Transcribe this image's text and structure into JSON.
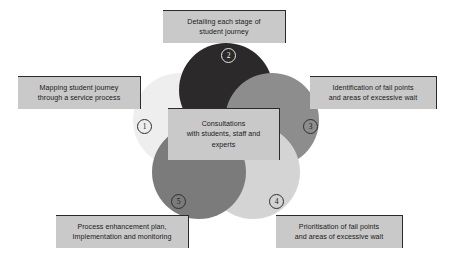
{
  "diagram": {
    "background_color": "#ffffff",
    "center": {
      "text": "Consultations\nwith students, staff and\nexperts",
      "box_color": "#c9c9c9",
      "shadow_color": "#2b2b2b",
      "x": 168,
      "y": 108,
      "w": 112,
      "h": 52
    },
    "circles": [
      {
        "id": 1,
        "name": "mapping-student-journey",
        "color": "#efeeee",
        "cx": 47,
        "cy": 72,
        "r": 47
      },
      {
        "id": 2,
        "name": "detailing-each-stage",
        "color": "#2b2929",
        "cx": 93,
        "cy": 42,
        "r": 47
      },
      {
        "id": 3,
        "name": "identification-fail-points",
        "color": "#8d8d8d",
        "cx": 139,
        "cy": 72,
        "r": 47
      },
      {
        "id": 4,
        "name": "prioritisation-fail-points",
        "color": "#d5d4d4",
        "cx": 120,
        "cy": 124,
        "r": 47
      },
      {
        "id": 5,
        "name": "process-enhancement-plan",
        "color": "#7c7b7b",
        "cx": 66,
        "cy": 124,
        "r": 47
      }
    ],
    "markers": [
      {
        "id": 1,
        "label": "1",
        "x": 137,
        "y": 119,
        "tone": "onlight"
      },
      {
        "id": 2,
        "label": "2",
        "x": 221,
        "y": 48,
        "tone": "ondark"
      },
      {
        "id": 3,
        "label": "3",
        "x": 303,
        "y": 119,
        "tone": "onlight"
      },
      {
        "id": 4,
        "label": "4",
        "x": 269,
        "y": 194,
        "tone": "onlight"
      },
      {
        "id": 5,
        "label": "5",
        "x": 171,
        "y": 194,
        "tone": "onlight"
      }
    ],
    "labels": [
      {
        "id": 1,
        "name": "label-mapping-student-journey",
        "text": "Mapping student journey\nthrough a service process",
        "x": 18,
        "y": 76,
        "w": 123,
        "h": 33
      },
      {
        "id": 2,
        "name": "label-detailing-each-stage",
        "text": "Detailing each stage of\nstudent journey",
        "x": 163,
        "y": 10,
        "w": 123,
        "h": 33
      },
      {
        "id": 3,
        "name": "label-identification-fail-points",
        "text": "Identification of fail points\nand areas of excessive wait",
        "x": 310,
        "y": 76,
        "w": 127,
        "h": 33
      },
      {
        "id": 4,
        "name": "label-prioritisation-fail-points",
        "text": "Prioritisation of fail points\nand areas of excessive wait",
        "x": 276,
        "y": 215,
        "w": 127,
        "h": 33
      },
      {
        "id": 5,
        "name": "label-process-enhancement-plan",
        "text": "Process enhancement plan,\nImplementation and monitoring",
        "x": 56,
        "y": 215,
        "w": 133,
        "h": 33
      }
    ]
  }
}
